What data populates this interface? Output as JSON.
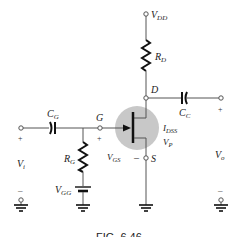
{
  "diagram": {
    "type": "JFET fixed-bias common-source amplifier",
    "supply": {
      "label_main": "V",
      "label_sub": "DD"
    },
    "drain_resistor": {
      "label_main": "R",
      "label_sub": "D"
    },
    "drain_node": {
      "label": "D"
    },
    "coupling_output": {
      "label_main": "C",
      "label_sub": "C"
    },
    "coupling_input": {
      "label_main": "C",
      "label_sub": "G"
    },
    "gate_node": {
      "label": "G"
    },
    "gate_resistor": {
      "label_main": "R",
      "label_sub": "G"
    },
    "gate_supply": {
      "label_main": "V",
      "label_sub": "GG"
    },
    "vgs": {
      "label_main": "V",
      "label_sub": "GS",
      "plus": "+",
      "minus": "–"
    },
    "source_node": {
      "label": "S"
    },
    "transistor_params": {
      "idss_main": "I",
      "idss_sub": "DSS",
      "vp_main": "V",
      "vp_sub": "P"
    },
    "input": {
      "label_main": "V",
      "label_sub": "i",
      "plus": "+",
      "minus": "–"
    },
    "output": {
      "label_main": "V",
      "label_sub": "o",
      "plus": "+",
      "minus": "–"
    },
    "caption": "FIG. 6.46"
  },
  "colors": {
    "wire": "#555555",
    "component": "#111111",
    "jfet_highlight": "#c8c8c8"
  }
}
